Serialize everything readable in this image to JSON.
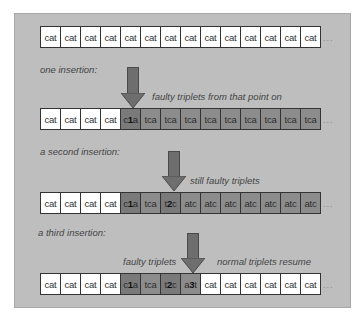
{
  "rows": [
    {
      "cells": [
        {
          "t": "cat",
          "s": "w"
        },
        {
          "t": "cat",
          "s": "w"
        },
        {
          "t": "cat",
          "s": "w"
        },
        {
          "t": "cat",
          "s": "w"
        },
        {
          "t": "cat",
          "s": "w"
        },
        {
          "t": "cat",
          "s": "w"
        },
        {
          "t": "cat",
          "s": "w"
        },
        {
          "t": "cat",
          "s": "w"
        },
        {
          "t": "cat",
          "s": "w"
        },
        {
          "t": "cat",
          "s": "w"
        },
        {
          "t": "cat",
          "s": "w"
        },
        {
          "t": "cat",
          "s": "w"
        },
        {
          "t": "cat",
          "s": "w"
        },
        {
          "t": "cat",
          "s": "w"
        }
      ],
      "ellipsis": "..."
    },
    {
      "cells": [
        {
          "t": "cat",
          "s": "w"
        },
        {
          "t": "cat",
          "s": "w"
        },
        {
          "t": "cat",
          "s": "w"
        },
        {
          "t": "cat",
          "s": "w"
        },
        {
          "t": "c1a",
          "s": "d",
          "bold": "1"
        },
        {
          "t": "tca",
          "s": "m"
        },
        {
          "t": "tca",
          "s": "m"
        },
        {
          "t": "tca",
          "s": "m"
        },
        {
          "t": "tca",
          "s": "m"
        },
        {
          "t": "tca",
          "s": "m"
        },
        {
          "t": "tca",
          "s": "m"
        },
        {
          "t": "tca",
          "s": "m"
        },
        {
          "t": "tca",
          "s": "m"
        },
        {
          "t": "tca",
          "s": "m"
        }
      ],
      "ellipsis": "..."
    },
    {
      "cells": [
        {
          "t": "cat",
          "s": "w"
        },
        {
          "t": "cat",
          "s": "w"
        },
        {
          "t": "cat",
          "s": "w"
        },
        {
          "t": "cat",
          "s": "w"
        },
        {
          "t": "c1a",
          "s": "d",
          "bold": "1"
        },
        {
          "t": "tca",
          "s": "m"
        },
        {
          "t": "t2c",
          "s": "d",
          "bold": "2"
        },
        {
          "t": "atc",
          "s": "m"
        },
        {
          "t": "atc",
          "s": "m"
        },
        {
          "t": "atc",
          "s": "m"
        },
        {
          "t": "atc",
          "s": "m"
        },
        {
          "t": "atc",
          "s": "m"
        },
        {
          "t": "atc",
          "s": "m"
        },
        {
          "t": "atc",
          "s": "m"
        }
      ],
      "ellipsis": "..."
    },
    {
      "cells": [
        {
          "t": "cat",
          "s": "w"
        },
        {
          "t": "cat",
          "s": "w"
        },
        {
          "t": "cat",
          "s": "w"
        },
        {
          "t": "cat",
          "s": "w"
        },
        {
          "t": "c1a",
          "s": "d",
          "bold": "1"
        },
        {
          "t": "tca",
          "s": "m"
        },
        {
          "t": "t2c",
          "s": "d",
          "bold": "2"
        },
        {
          "t": "a3t",
          "s": "m",
          "bold": "3"
        },
        {
          "t": "cat",
          "s": "w"
        },
        {
          "t": "cat",
          "s": "w"
        },
        {
          "t": "cat",
          "s": "w"
        },
        {
          "t": "cat",
          "s": "w"
        },
        {
          "t": "cat",
          "s": "w"
        },
        {
          "t": "cat",
          "s": "w"
        }
      ],
      "ellipsis": "..."
    }
  ],
  "labels": {
    "one_insertion": "one insertion:",
    "faulty_from_point": "faulty triplets from that point on",
    "second_insertion": "a second insertion:",
    "still_faulty": "still faulty triplets",
    "third_insertion": "a third insertion:",
    "faulty_triplets": "faulty triplets",
    "normal_resume": "normal triplets resume"
  },
  "colors": {
    "frame_bg": "#bebebe",
    "normal_cell": "#ffffff",
    "insertion_cell": "#7a7a7a",
    "shifted_cell": "#8c8c8c",
    "arrow": "#6e6e6e"
  }
}
